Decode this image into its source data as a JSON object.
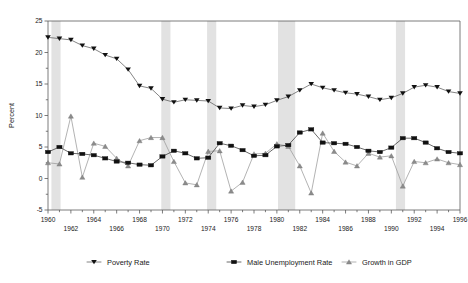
{
  "chart_data": {
    "type": "line",
    "title": "",
    "xlabel": "",
    "ylabel": "Percent",
    "ylim": [
      -5,
      25
    ],
    "xlim": [
      1960,
      1996
    ],
    "ytick_values": [
      25,
      20,
      15,
      10,
      5,
      0,
      -5
    ],
    "ytick_labels": [
      "25",
      "20",
      "15",
      "10",
      "5",
      "0",
      "-5"
    ],
    "yminor_step": 2.5,
    "grid": false,
    "legend_position": "bottom",
    "x": [
      1960,
      1961,
      1962,
      1963,
      1964,
      1965,
      1966,
      1967,
      1968,
      1969,
      1970,
      1971,
      1972,
      1973,
      1974,
      1975,
      1976,
      1977,
      1978,
      1979,
      1980,
      1981,
      1982,
      1983,
      1984,
      1985,
      1986,
      1987,
      1988,
      1989,
      1990,
      1991,
      1992,
      1993,
      1994,
      1995,
      1996
    ],
    "xtick_labels_top": [
      "1960",
      "",
      "1964",
      "",
      "1968",
      "",
      "1972",
      "",
      "1976",
      "",
      "1980",
      "",
      "1984",
      "",
      "1988",
      "",
      "1992",
      "",
      "1996"
    ],
    "xtick_labels_bottom": [
      "",
      "1962",
      "",
      "1966",
      "",
      "1970",
      "",
      "1974",
      "",
      "1978",
      "",
      "1982",
      "",
      "1986",
      "",
      "1990",
      "",
      "1994",
      ""
    ],
    "xtick_top": [
      1960,
      1964,
      1968,
      1972,
      1976,
      1980,
      1984,
      1988,
      1992,
      1996
    ],
    "xtick_bottom": [
      1962,
      1966,
      1970,
      1974,
      1978,
      1982,
      1986,
      1990,
      1994
    ],
    "series": [
      {
        "name": "Poverty Rate",
        "marker": "triangle-down",
        "color": "#111111",
        "values": [
          22.4,
          22.2,
          22.0,
          21.1,
          20.6,
          19.6,
          19.0,
          17.3,
          14.7,
          14.3,
          12.6,
          12.1,
          12.5,
          12.4,
          12.3,
          11.2,
          11.1,
          11.6,
          11.4,
          11.7,
          12.4,
          13.0,
          14.0,
          15.0,
          14.4,
          14.0,
          13.6,
          13.4,
          13.0,
          12.5,
          12.8,
          13.5,
          14.5,
          14.8,
          14.5,
          13.8,
          13.5
        ]
      },
      {
        "name": "Male Unemployment Rate",
        "marker": "square",
        "color": "#111111",
        "values": [
          4.2,
          5.0,
          4.0,
          3.9,
          3.7,
          3.2,
          2.7,
          2.5,
          2.2,
          2.1,
          3.5,
          4.4,
          4.0,
          3.2,
          3.3,
          5.6,
          5.2,
          4.5,
          3.6,
          3.7,
          5.1,
          5.3,
          7.3,
          7.8,
          5.7,
          5.6,
          5.5,
          5.0,
          4.4,
          4.2,
          4.9,
          6.4,
          6.4,
          5.7,
          4.8,
          4.2,
          4.0
        ]
      },
      {
        "name": "Growth in GDP",
        "marker": "triangle-up",
        "color": "#8c8c8c",
        "values": [
          2.5,
          2.3,
          9.9,
          0.2,
          5.6,
          5.1,
          3.2,
          2.0,
          6.0,
          6.5,
          6.5,
          2.7,
          -0.7,
          -1.0,
          4.3,
          4.4,
          -2.0,
          -0.6,
          3.9,
          4.0,
          5.5,
          5.1,
          2.0,
          -2.3,
          7.2,
          4.3,
          2.6,
          2.0,
          4.0,
          3.4,
          3.6,
          -1.2,
          2.7,
          2.5,
          3.1,
          2.5,
          2.2
        ]
      }
    ],
    "recessions": [
      {
        "start": 1960.3,
        "end": 1961.1
      },
      {
        "start": 1969.9,
        "end": 1970.7
      },
      {
        "start": 1973.9,
        "end": 1974.7
      },
      {
        "start": 1980.1,
        "end": 1981.6
      },
      {
        "start": 1990.4,
        "end": 1991.2
      }
    ]
  },
  "legend": {
    "items": [
      {
        "label": "Poverty Rate",
        "marker": "triangle-down"
      },
      {
        "label": "Male Unemployment Rate",
        "marker": "square"
      },
      {
        "label": "Growth in GDP",
        "marker": "triangle-up"
      }
    ]
  }
}
